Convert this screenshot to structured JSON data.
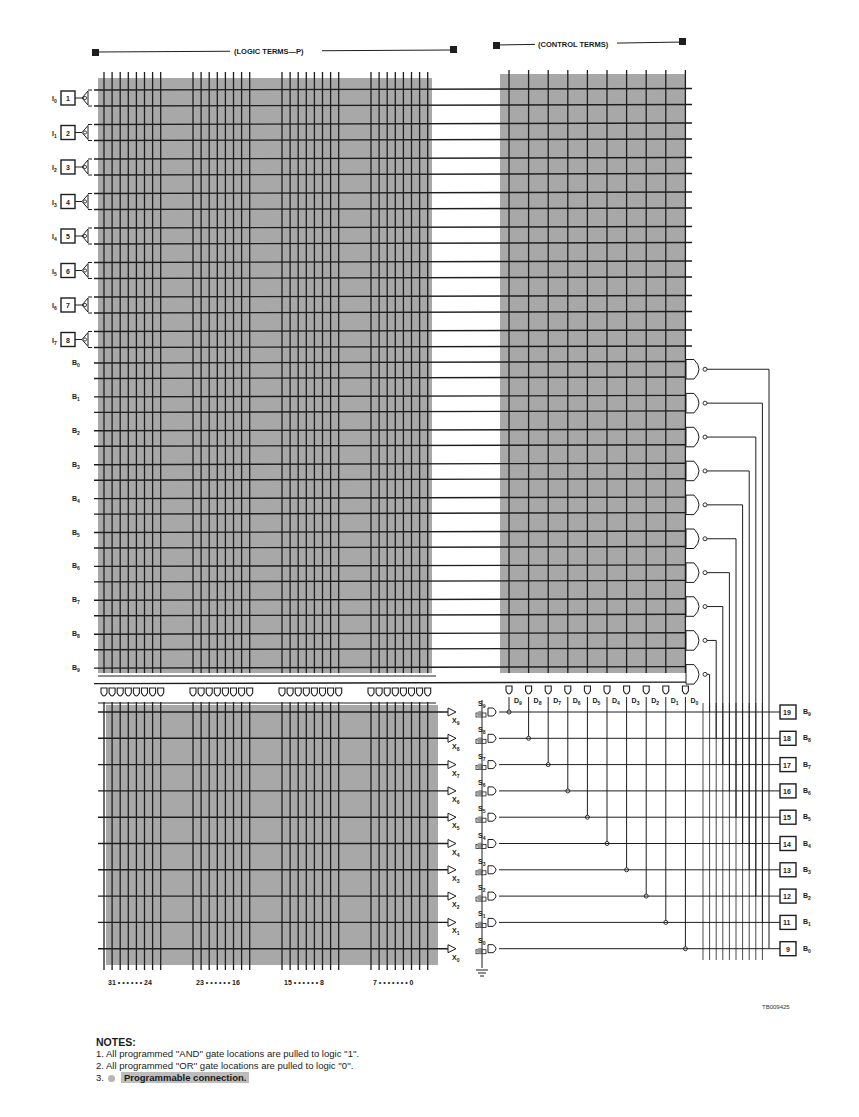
{
  "header": {
    "logic_terms_label": "(LOGIC TERMS—P)",
    "control_terms_label": "(CONTROL TERMS)"
  },
  "inputs": [
    {
      "pin": "1",
      "label": "I",
      "sub": "0"
    },
    {
      "pin": "2",
      "label": "I",
      "sub": "1"
    },
    {
      "pin": "3",
      "label": "I",
      "sub": "2"
    },
    {
      "pin": "4",
      "label": "I",
      "sub": "3"
    },
    {
      "pin": "5",
      "label": "I",
      "sub": "4"
    },
    {
      "pin": "6",
      "label": "I",
      "sub": "5"
    },
    {
      "pin": "7",
      "label": "I",
      "sub": "6"
    },
    {
      "pin": "8",
      "label": "I",
      "sub": "7"
    }
  ],
  "feedback_rows": [
    {
      "label": "B",
      "sub": "0"
    },
    {
      "label": "B",
      "sub": "1"
    },
    {
      "label": "B",
      "sub": "2"
    },
    {
      "label": "B",
      "sub": "3"
    },
    {
      "label": "B",
      "sub": "4"
    },
    {
      "label": "B",
      "sub": "5"
    },
    {
      "label": "B",
      "sub": "6"
    },
    {
      "label": "B",
      "sub": "7"
    },
    {
      "label": "B",
      "sub": "8"
    },
    {
      "label": "B",
      "sub": "9"
    }
  ],
  "control_terms": [
    {
      "label": "D",
      "sub": "9"
    },
    {
      "label": "D",
      "sub": "8"
    },
    {
      "label": "D",
      "sub": "7"
    },
    {
      "label": "D",
      "sub": "6"
    },
    {
      "label": "D",
      "sub": "5"
    },
    {
      "label": "D",
      "sub": "4"
    },
    {
      "label": "D",
      "sub": "3"
    },
    {
      "label": "D",
      "sub": "2"
    },
    {
      "label": "D",
      "sub": "1"
    },
    {
      "label": "D",
      "sub": "0"
    }
  ],
  "or_rows": [
    {
      "x": "X",
      "xs": "9",
      "s": "S",
      "ss": "9"
    },
    {
      "x": "X",
      "xs": "8",
      "s": "S",
      "ss": "8"
    },
    {
      "x": "X",
      "xs": "7",
      "s": "S",
      "ss": "7"
    },
    {
      "x": "X",
      "xs": "6",
      "s": "S",
      "ss": "6"
    },
    {
      "x": "X",
      "xs": "5",
      "s": "S",
      "ss": "5"
    },
    {
      "x": "X",
      "xs": "4",
      "s": "S",
      "ss": "4"
    },
    {
      "x": "X",
      "xs": "3",
      "s": "S",
      "ss": "3"
    },
    {
      "x": "X",
      "xs": "2",
      "s": "S",
      "ss": "2"
    },
    {
      "x": "X",
      "xs": "1",
      "s": "S",
      "ss": "1"
    },
    {
      "x": "X",
      "xs": "0",
      "s": "S",
      "ss": "0"
    }
  ],
  "outputs": [
    {
      "pin": "19",
      "label": "B",
      "sub": "9"
    },
    {
      "pin": "18",
      "label": "B",
      "sub": "8"
    },
    {
      "pin": "17",
      "label": "B",
      "sub": "7"
    },
    {
      "pin": "16",
      "label": "B",
      "sub": "6"
    },
    {
      "pin": "15",
      "label": "B",
      "sub": "5"
    },
    {
      "pin": "14",
      "label": "B",
      "sub": "4"
    },
    {
      "pin": "13",
      "label": "B",
      "sub": "3"
    },
    {
      "pin": "12",
      "label": "B",
      "sub": "2"
    },
    {
      "pin": "11",
      "label": "B",
      "sub": "1"
    },
    {
      "pin": "9",
      "label": "B",
      "sub": "0"
    }
  ],
  "product_term_groups": [
    {
      "label": "31 • • • • • • 24"
    },
    {
      "label": "23 • • • • • • 16"
    },
    {
      "label": "15 • • • • • • 8"
    },
    {
      "label": "7 • • • • • • • 0"
    }
  ],
  "figure_id": "TB009425",
  "notes": {
    "title": "NOTES:",
    "items": [
      "1. All programmed ''AND'' gate locations are pulled to logic ''1''.",
      "2. All programmed ''OR'' gate locations are pulled to logic ''0''."
    ],
    "item3_number": "3.",
    "item3_text": "Programmable connection."
  },
  "colors": {
    "array_fill": "#a8a8a8",
    "line": "#1e1e1e",
    "background": "#ffffff"
  }
}
